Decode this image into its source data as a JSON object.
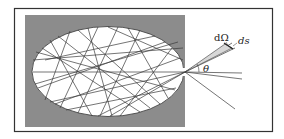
{
  "figure": {
    "labels": {
      "solid_angle": "dΩ",
      "surface_element": "ds",
      "angle": "θ"
    },
    "colors": {
      "frame": "#333333",
      "gray_box": "#8c8c8c",
      "ellipse_fill": "#ffffff",
      "ray": "#3a3a3a"
    }
  }
}
